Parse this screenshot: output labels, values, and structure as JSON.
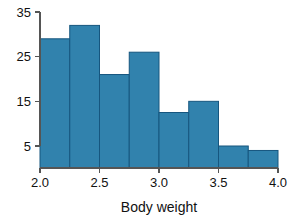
{
  "chart_data": {
    "type": "bar",
    "title": "",
    "subtitle": "",
    "xlabel": "Body weight",
    "ylabel": "",
    "orientation": "vertical",
    "grid": false,
    "legend": false,
    "legend_position": "none",
    "bin_width": 0.25,
    "xlim": [
      2.0,
      4.0
    ],
    "ylim": [
      0,
      35
    ],
    "x_ticks": [
      "2.0",
      "2.5",
      "3.0",
      "3.5",
      "4.0"
    ],
    "x_tick_values": [
      2.0,
      2.5,
      3.0,
      3.5,
      4.0
    ],
    "y_ticks": [
      "35",
      "25",
      "15",
      "5"
    ],
    "y_tick_values": [
      35,
      25,
      15,
      5
    ],
    "bin_edges": [
      2.0,
      2.25,
      2.5,
      2.75,
      3.0,
      3.25,
      3.5,
      3.75,
      4.0
    ],
    "categories": [
      "2.00-2.25",
      "2.25-2.50",
      "2.50-2.75",
      "2.75-3.00",
      "3.00-3.25",
      "3.25-3.50",
      "3.50-3.75",
      "3.75-4.00"
    ],
    "values": [
      29,
      32,
      21,
      26,
      12.5,
      15,
      5,
      4
    ],
    "bar_fill": "#3182ad",
    "bar_stroke": "#16567f",
    "axis_color": "#555555",
    "text_color": "#111111",
    "background": "#ffffff"
  }
}
